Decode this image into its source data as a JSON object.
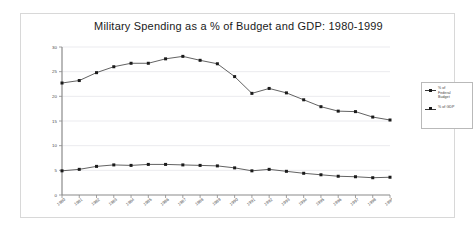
{
  "chart_data": {
    "type": "line",
    "title": "Military Spending as a % of Budget and GDP: 1980-1999",
    "xlabel": "",
    "ylabel": "",
    "ylim": [
      0,
      30
    ],
    "yticks": [
      "0",
      "5",
      "10",
      "15",
      "20",
      "25",
      "30"
    ],
    "grid": true,
    "legend_position": "right",
    "categories": [
      "1980",
      "1981",
      "1982",
      "1983",
      "1984",
      "1985",
      "1986",
      "1987",
      "1988",
      "1989",
      "1990",
      "1991",
      "1992",
      "1993",
      "1994",
      "1995",
      "1996",
      "1997",
      "1998",
      "1999"
    ],
    "series": [
      {
        "name": "% of Federal Budget",
        "values": [
          22.7,
          23.2,
          24.8,
          26.0,
          26.7,
          26.7,
          27.6,
          28.1,
          27.3,
          26.6,
          24.0,
          20.6,
          21.6,
          20.7,
          19.3,
          17.9,
          17.0,
          16.9,
          15.8,
          15.2
        ]
      },
      {
        "name": "% of GDP",
        "values": [
          4.9,
          5.2,
          5.8,
          6.1,
          6.0,
          6.2,
          6.2,
          6.1,
          6.0,
          5.9,
          5.5,
          4.9,
          5.2,
          4.8,
          4.4,
          4.1,
          3.8,
          3.7,
          3.5,
          3.6
        ]
      }
    ]
  },
  "legend": {
    "entries": [
      {
        "label": "% of\nFederal\nBudget"
      },
      {
        "label": "% of GDP"
      }
    ]
  }
}
